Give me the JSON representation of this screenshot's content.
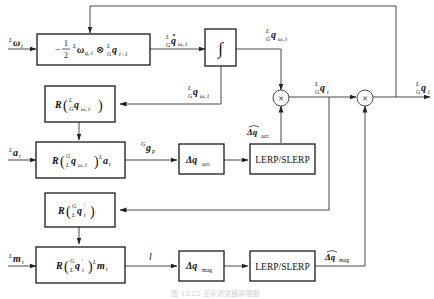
{
  "diagram": {
    "type": "block-diagram",
    "inputs": {
      "gyro": "ᴸω_t",
      "accel": "ᴸa_t",
      "mag": "ᴸm_t"
    },
    "blocks": [
      {
        "id": "quat-derivative",
        "label": "−½ ᴸω_q,t ⊗ ᴸ_G q_t−1"
      },
      {
        "id": "integrator",
        "label": "∫"
      },
      {
        "id": "rotation-gyro",
        "label": "R(ᴸ_G q_ω,t)"
      },
      {
        "id": "rotate-accel",
        "label": "R(ᴳ_L q_ω,t) ᴸa_t"
      },
      {
        "id": "delta-q-acc",
        "label": "Δq_acc"
      },
      {
        "id": "lerp-slerp-acc",
        "label": "LERP/SLERP"
      },
      {
        "id": "rotation-prime",
        "label": "R(ᴳ_L q′_t)"
      },
      {
        "id": "rotate-mag",
        "label": "R(ᴳ_L q′_t) ᴸm_t"
      },
      {
        "id": "delta-q-mag",
        "label": "Δq_mag"
      },
      {
        "id": "lerp-slerp-mag",
        "label": "LERP/SLERP"
      },
      {
        "id": "multiply-1",
        "label": "⊗"
      },
      {
        "id": "multiply-2",
        "label": "⊗"
      }
    ],
    "signals": {
      "q_dot": "ᴸ_G q̇_ω,t",
      "q_omega_out": "ᴸ_G q_ω,t",
      "q_omega_fb": "ᴸ_G q_ω,t",
      "g_p": "ᴳg_p",
      "dq_acc_hat": "Δq̂_acc",
      "q_prime": "ᴸ_G q′_t",
      "l": "l",
      "dq_mag_hat": "Δq̂_mag",
      "output": "ᴸ_G q_t"
    },
    "text": {
      "in_omega_sup": "L",
      "in_omega": "ω",
      "in_omega_sub": "t",
      "in_a_sup": "L",
      "in_a": "a",
      "in_a_sub": "t",
      "in_m_sup": "L",
      "in_m": "m",
      "in_m_sub": "t",
      "blk1_minus": "−",
      "blk1_num": "1",
      "blk1_den": "2",
      "blk1_rest": "ω",
      "blk1_sub": "q, t",
      "blk1_otimes": "⊗",
      "blk1_q": "q",
      "blk1_qsub": "t−1",
      "integral": "∫",
      "R": "R",
      "q": "q",
      "sub_wt": "ω, t",
      "sup_L": "L",
      "sub_G": "G",
      "sup_G": "G",
      "sub_L": "L",
      "a": "a",
      "t": "t",
      "m": "m",
      "g": "g",
      "p": "p",
      "delta_q": "Δq",
      "acc": "acc",
      "mag": "mag",
      "lerp": "LERP/SLERP",
      "l": "l",
      "prime": "′",
      "otimes": "×",
      "caption": "图 13.25   互补滤波器原理图"
    }
  }
}
